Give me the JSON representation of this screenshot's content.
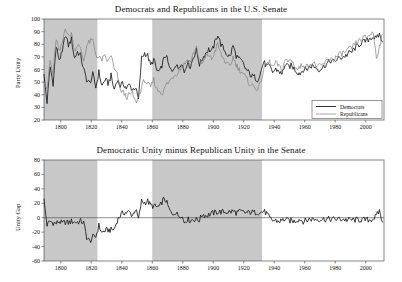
{
  "figure": {
    "background": "#ffffff",
    "shade_color": "#c8c8c8",
    "axis_color": "#555555",
    "democrat_color": "#1a1a1a",
    "republican_color": "#808080"
  },
  "panels": [
    {
      "id": "senate-party-unity",
      "title": "Democrats and Republicans in the U.S. Senate",
      "ylabel": "Party Unity",
      "legend": {
        "position": "lower-right",
        "entries": [
          "Democrats",
          "Republicans"
        ]
      }
    },
    {
      "id": "senate-unity-gap",
      "title": "Democratic Unity minus Republican Unity in the Senate",
      "ylabel": "Unity Gap",
      "legend": {
        "position": "none",
        "entries": []
      }
    }
  ],
  "chart_data": [
    {
      "type": "line",
      "id": "senate-party-unity",
      "title": "Democrats and Republicans in the U.S. Senate",
      "xlabel": "",
      "ylabel": "Party Unity",
      "xlim": [
        1789,
        2012
      ],
      "ylim": [
        20,
        100
      ],
      "xticks": [
        1800,
        1820,
        1840,
        1860,
        1880,
        1900,
        1920,
        1940,
        1960,
        1980,
        2000
      ],
      "yticks": [
        20,
        30,
        40,
        50,
        60,
        70,
        80,
        90,
        100
      ],
      "grid": false,
      "legend": [
        "Democrats",
        "Republicans"
      ],
      "shaded_spans": [
        {
          "x0": 1789,
          "x1": 1824
        },
        {
          "x0": 1860,
          "x1": 1932
        }
      ],
      "x": [
        1789,
        1791,
        1793,
        1795,
        1797,
        1799,
        1801,
        1803,
        1805,
        1807,
        1809,
        1811,
        1813,
        1815,
        1817,
        1819,
        1821,
        1823,
        1825,
        1827,
        1829,
        1831,
        1833,
        1835,
        1837,
        1839,
        1841,
        1843,
        1845,
        1847,
        1849,
        1851,
        1853,
        1855,
        1857,
        1859,
        1861,
        1863,
        1865,
        1867,
        1869,
        1871,
        1873,
        1875,
        1877,
        1879,
        1881,
        1883,
        1885,
        1887,
        1889,
        1891,
        1893,
        1895,
        1897,
        1899,
        1901,
        1903,
        1905,
        1907,
        1909,
        1911,
        1913,
        1915,
        1917,
        1919,
        1921,
        1923,
        1925,
        1927,
        1929,
        1931,
        1933,
        1935,
        1937,
        1939,
        1941,
        1943,
        1945,
        1947,
        1949,
        1951,
        1953,
        1955,
        1957,
        1959,
        1961,
        1963,
        1965,
        1967,
        1969,
        1971,
        1973,
        1975,
        1977,
        1979,
        1981,
        1983,
        1985,
        1987,
        1989,
        1991,
        1993,
        1995,
        1997,
        1999,
        2001,
        2003,
        2005,
        2007,
        2009,
        2011
      ],
      "series": [
        {
          "name": "Democrats",
          "color": "#1a1a1a",
          "values": [
            55,
            34,
            62,
            49,
            78,
            68,
            73,
            88,
            79,
            84,
            69,
            74,
            71,
            60,
            52,
            49,
            56,
            46,
            58,
            47,
            52,
            49,
            55,
            44,
            52,
            47,
            49,
            45,
            48,
            44,
            46,
            36,
            69,
            73,
            71,
            63,
            68,
            59,
            58,
            66,
            72,
            62,
            58,
            64,
            61,
            66,
            58,
            66,
            62,
            70,
            75,
            64,
            69,
            73,
            76,
            74,
            81,
            88,
            80,
            76,
            72,
            70,
            79,
            71,
            68,
            66,
            61,
            58,
            55,
            54,
            52,
            57,
            66,
            63,
            62,
            58,
            60,
            59,
            56,
            64,
            62,
            63,
            61,
            58,
            57,
            60,
            60,
            62,
            63,
            62,
            60,
            61,
            63,
            65,
            67,
            66,
            68,
            69,
            70,
            71,
            73,
            74,
            77,
            79,
            81,
            82,
            83,
            85,
            86,
            84,
            88,
            82
          ]
        },
        {
          "name": "Republicans",
          "color": "#808080",
          "values": [
            52,
            43,
            67,
            56,
            85,
            73,
            81,
            94,
            86,
            89,
            75,
            80,
            76,
            67,
            79,
            82,
            83,
            72,
            69,
            68,
            70,
            66,
            72,
            60,
            56,
            44,
            42,
            38,
            40,
            41,
            34,
            38,
            46,
            52,
            48,
            46,
            52,
            44,
            43,
            41,
            48,
            50,
            54,
            56,
            58,
            62,
            64,
            68,
            66,
            72,
            78,
            67,
            64,
            70,
            72,
            68,
            74,
            80,
            72,
            68,
            64,
            62,
            70,
            64,
            60,
            58,
            54,
            50,
            48,
            46,
            45,
            48,
            60,
            64,
            66,
            62,
            65,
            63,
            58,
            68,
            66,
            68,
            64,
            60,
            62,
            64,
            62,
            64,
            65,
            64,
            62,
            63,
            65,
            67,
            69,
            68,
            70,
            72,
            73,
            74,
            76,
            77,
            80,
            82,
            84,
            85,
            86,
            88,
            89,
            70,
            78,
            88
          ]
        }
      ]
    },
    {
      "type": "line",
      "id": "senate-unity-gap",
      "title": "Democratic Unity minus Republican Unity in the Senate",
      "xlabel": "",
      "ylabel": "Unity Gap",
      "xlim": [
        1789,
        2012
      ],
      "ylim": [
        -60,
        80
      ],
      "xticks": [
        1800,
        1820,
        1840,
        1860,
        1880,
        1900,
        1920,
        1940,
        1960,
        1980,
        2000
      ],
      "yticks": [
        -60,
        -40,
        -20,
        0,
        20,
        40,
        60,
        80
      ],
      "grid": false,
      "zero_line": 0,
      "legend": [],
      "shaded_spans": [
        {
          "x0": 1789,
          "x1": 1824
        },
        {
          "x0": 1860,
          "x1": 1932
        }
      ],
      "x": [
        1789,
        1791,
        1793,
        1795,
        1797,
        1799,
        1801,
        1803,
        1805,
        1807,
        1809,
        1811,
        1813,
        1815,
        1817,
        1819,
        1821,
        1823,
        1825,
        1827,
        1829,
        1831,
        1833,
        1835,
        1837,
        1839,
        1841,
        1843,
        1845,
        1847,
        1849,
        1851,
        1853,
        1855,
        1857,
        1859,
        1861,
        1863,
        1865,
        1867,
        1869,
        1871,
        1873,
        1875,
        1877,
        1879,
        1881,
        1883,
        1885,
        1887,
        1889,
        1891,
        1893,
        1895,
        1897,
        1899,
        1901,
        1903,
        1905,
        1907,
        1909,
        1911,
        1913,
        1915,
        1917,
        1919,
        1921,
        1923,
        1925,
        1927,
        1929,
        1931,
        1933,
        1935,
        1937,
        1939,
        1941,
        1943,
        1945,
        1947,
        1949,
        1951,
        1953,
        1955,
        1957,
        1959,
        1961,
        1963,
        1965,
        1967,
        1969,
        1971,
        1973,
        1975,
        1977,
        1979,
        1981,
        1983,
        1985,
        1987,
        1989,
        1991,
        1993,
        1995,
        1997,
        1999,
        2001,
        2003,
        2005,
        2007,
        2009,
        2011
      ],
      "series": [
        {
          "name": "Unity Gap",
          "color": "#1a1a1a",
          "values": [
            24,
            -10,
            -5,
            -7,
            -8,
            -5,
            -8,
            -6,
            -7,
            -5,
            -6,
            -6,
            -5,
            -7,
            -27,
            -33,
            -27,
            -26,
            -11,
            -21,
            -18,
            -17,
            -17,
            -16,
            -4,
            3,
            7,
            7,
            8,
            3,
            12,
            -2,
            23,
            21,
            23,
            17,
            16,
            15,
            15,
            25,
            24,
            12,
            4,
            8,
            3,
            4,
            -6,
            -2,
            -4,
            -2,
            -3,
            -3,
            5,
            3,
            4,
            6,
            7,
            8,
            8,
            8,
            8,
            8,
            9,
            7,
            8,
            8,
            7,
            7,
            8,
            7,
            8,
            7,
            9,
            6,
            -1,
            -4,
            -4,
            -5,
            -4,
            -2,
            -4,
            -4,
            -5,
            -3,
            -2,
            -5,
            -4,
            -2,
            -2,
            -2,
            -2,
            -2,
            -2,
            -2,
            -2,
            -2,
            -2,
            -2,
            -2,
            -3,
            -3,
            -3,
            -3,
            -3,
            -3,
            -3,
            -3,
            -3,
            -1,
            2,
            10,
            -6
          ]
        }
      ]
    }
  ]
}
